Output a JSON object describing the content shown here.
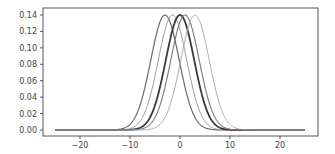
{
  "chart_data": {
    "type": "line",
    "title": "",
    "xlabel": "",
    "ylabel": "",
    "xlim": [
      -27.5,
      27.5
    ],
    "ylim": [
      -0.008,
      0.148
    ],
    "grid": false,
    "legend": null,
    "x_ticks": [
      -20,
      -10,
      0,
      10,
      20
    ],
    "x_tick_labels": [
      "−20",
      "−10",
      "0",
      "10",
      "20"
    ],
    "y_ticks": [
      0.0,
      0.02,
      0.04,
      0.06,
      0.08,
      0.1,
      0.12,
      0.14
    ],
    "y_tick_labels": [
      "0.00",
      "0.02",
      "0.04",
      "0.06",
      "0.08",
      "0.10",
      "0.12",
      "0.14"
    ],
    "x_range": [
      -25,
      25
    ],
    "series": [
      {
        "name": "gaussian mean -3",
        "mean": -3,
        "sigma": 2.85,
        "peak": 0.14,
        "color": "#6a6a6a",
        "width": 1.2
      },
      {
        "name": "gaussian mean -1.5",
        "mean": -1.5,
        "sigma": 2.85,
        "peak": 0.14,
        "color": "#999999",
        "width": 1.0
      },
      {
        "name": "gaussian mean 0",
        "mean": 0,
        "sigma": 2.85,
        "peak": 0.14,
        "color": "#3a3a3a",
        "width": 1.8
      },
      {
        "name": "gaussian mean 1",
        "mean": 1,
        "sigma": 2.85,
        "peak": 0.14,
        "color": "#7a7a7a",
        "width": 1.1
      },
      {
        "name": "gaussian mean 3",
        "mean": 3,
        "sigma": 2.85,
        "peak": 0.14,
        "color": "#aaaaaa",
        "width": 1.0
      }
    ]
  }
}
